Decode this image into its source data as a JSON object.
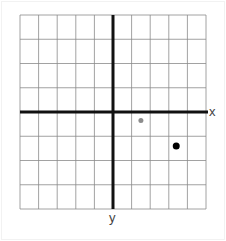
{
  "diagram": {
    "type": "coordinate-grid",
    "grid": {
      "columns": 10,
      "rows": 8,
      "line_color": "#8a8a8a",
      "axis_color": "#111111"
    },
    "axes": {
      "x_label": "x",
      "y_label": "y"
    },
    "points": [
      {
        "name": "gray-point",
        "x": 1.5,
        "y": -0.35,
        "color": "#8c8c8c",
        "radius": 2.5
      },
      {
        "name": "black-point",
        "x": 3.4,
        "y": -1.4,
        "color": "#000000",
        "radius": 3.5
      }
    ]
  }
}
